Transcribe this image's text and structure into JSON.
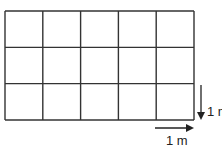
{
  "grid": {
    "columns": 5,
    "rows": 3,
    "x": 5,
    "y": 11,
    "width": 189,
    "height": 109,
    "line_color": "#333333"
  },
  "vertical_scale": {
    "label": "1 m",
    "direction": "down"
  },
  "horizontal_scale": {
    "label": "1 m",
    "direction": "right"
  }
}
